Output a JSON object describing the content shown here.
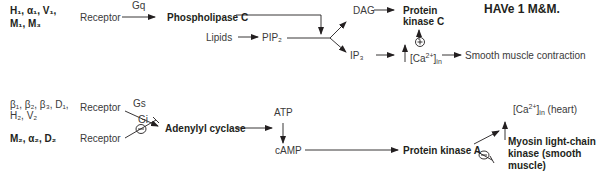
{
  "title": "HAVe 1 M&M.",
  "gq_pathway": {
    "receptors_line1": "H₁, α₁, V₁,",
    "receptors_line2": "M₁, M₃",
    "receptor": "Receptor",
    "g_protein": "Gq",
    "enzyme": "Phospholipase C",
    "lipids": "Lipids",
    "pip2": "PIP₂",
    "dag": "DAG",
    "ip3": "IP₃",
    "pkc_line1": "Protein",
    "pkc_line2": "kinase C",
    "plus_sign": "+",
    "ca_in": "↑ [Ca²⁺]in",
    "outcome": "Smooth muscle contraction"
  },
  "gs_pathway": {
    "receptors_line1": "β₁, β₂, β₃, D₁,",
    "receptors_line2": "H₂, V₂",
    "receptor": "Receptor",
    "g_protein": "Gs",
    "enzyme": "Adenylyl cyclase",
    "atp": "ATP",
    "camp": "cAMP",
    "pka": "Protein kinase A",
    "ca_heart": "↑ [Ca²⁺]in (heart)",
    "mlck_line1": "Myosin light-chain",
    "mlck_line2": "kinase (smooth",
    "mlck_line3": "muscle)",
    "minus_sign": "−"
  },
  "gi_pathway": {
    "receptors": "M₂, α₂, D₂",
    "receptor": "Receptor",
    "g_protein": "Gi",
    "minus_sign": "−"
  }
}
